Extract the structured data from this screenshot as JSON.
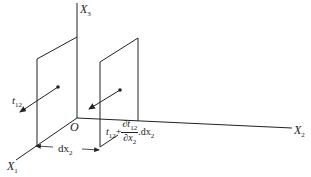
{
  "diagram": {
    "type": "3d-stress-element-diagram",
    "axes": {
      "x1": {
        "label": "X",
        "sub": "1"
      },
      "x2": {
        "label": "X",
        "sub": "2"
      },
      "x3": {
        "label": "X",
        "sub": "3"
      },
      "origin": "O"
    },
    "left_plane": {
      "traction_label": "t",
      "traction_sub": "12"
    },
    "right_plane": {
      "traction_base": "t",
      "traction_sub": "12",
      "plus": "+",
      "partial_num": "∂t",
      "partial_num_sub": "12",
      "partial_den": "∂x",
      "partial_den_sub": "2",
      "times": ".",
      "dx": "dx",
      "dx_sub": "2"
    },
    "spacing": {
      "label": "dx",
      "sub": "2"
    },
    "colors": {
      "line": "#222222",
      "background": "#ffffff"
    }
  }
}
